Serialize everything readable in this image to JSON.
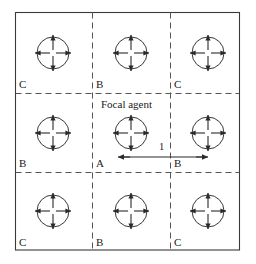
{
  "figure": {
    "type": "diagram",
    "width": 256,
    "height": 264,
    "background_color": "#ffffff",
    "line_color": "#333333",
    "dash_color": "#555555",
    "text_color": "#1a1a1a"
  },
  "frame": {
    "left": 15,
    "top": 12,
    "right": 240,
    "bottom": 250,
    "stroke_width": 1.1
  },
  "grid": {
    "vertical_dashed_x": [
      92,
      170
    ],
    "horizontal_dashed_y": [
      93,
      172
    ],
    "dash_pattern": "6 4"
  },
  "agents": [
    {
      "id": "agent-r1c1",
      "cx": 53,
      "cy": 53,
      "r": 16,
      "focal": false
    },
    {
      "id": "agent-r1c2",
      "cx": 131,
      "cy": 53,
      "r": 16,
      "focal": false
    },
    {
      "id": "agent-r1c3",
      "cx": 208,
      "cy": 53,
      "r": 16,
      "focal": false
    },
    {
      "id": "agent-r2c1",
      "cx": 53,
      "cy": 133,
      "r": 16,
      "focal": false
    },
    {
      "id": "agent-r2c2",
      "cx": 131,
      "cy": 133,
      "r": 16,
      "focal": true
    },
    {
      "id": "agent-r2c3",
      "cx": 208,
      "cy": 133,
      "r": 16,
      "focal": false
    },
    {
      "id": "agent-r3c1",
      "cx": 53,
      "cy": 211,
      "r": 16,
      "focal": false
    },
    {
      "id": "agent-r3c2",
      "cx": 131,
      "cy": 211,
      "r": 16,
      "focal": false
    },
    {
      "id": "agent-r3c3",
      "cx": 208,
      "cy": 211,
      "r": 16,
      "focal": false
    }
  ],
  "cell_labels": [
    {
      "id": "label-r1c1",
      "text": "C",
      "x": 19,
      "y": 79
    },
    {
      "id": "label-r1c2",
      "text": "B",
      "x": 96,
      "y": 79
    },
    {
      "id": "label-r1c3",
      "text": "C",
      "x": 174,
      "y": 79
    },
    {
      "id": "label-r2c1",
      "text": "B",
      "x": 19,
      "y": 158
    },
    {
      "id": "label-r2c2",
      "text": "A",
      "x": 96,
      "y": 158
    },
    {
      "id": "label-r2c3",
      "text": "B",
      "x": 174,
      "y": 158
    },
    {
      "id": "label-r3c1",
      "text": "C",
      "x": 19,
      "y": 237
    },
    {
      "id": "label-r3c2",
      "text": "B",
      "x": 96,
      "y": 237
    },
    {
      "id": "label-r3c3",
      "text": "C",
      "x": 174,
      "y": 237
    }
  ],
  "annotations": {
    "focal_caption": {
      "text": "Focal agent",
      "x": 101,
      "y": 99
    },
    "distance": {
      "value_label": "1",
      "label_x": 159,
      "label_y": 142,
      "arrow_y": 157,
      "arrow_x1": 118,
      "arrow_x2": 208
    }
  },
  "legend": {
    "meaning": {
      "A": "focal agent cell",
      "B": "edge-adjacent neighbour cell",
      "C": "corner-adjacent neighbour cell"
    }
  }
}
